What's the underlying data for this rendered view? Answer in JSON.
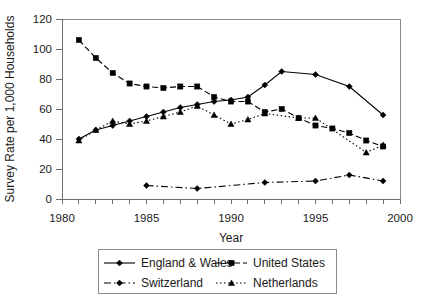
{
  "chart_data": {
    "type": "line",
    "title": "",
    "xlabel": "Year",
    "ylabel": "Survey Rate per 1,000 Households",
    "xlim": [
      1980,
      2000
    ],
    "ylim": [
      0,
      120
    ],
    "ytick_values": [
      0,
      20,
      40,
      60,
      80,
      100,
      120
    ],
    "ytick_labels": [
      "0",
      "20",
      "40",
      "60",
      "80",
      "100",
      "120"
    ],
    "xtick_values": [
      1980,
      1985,
      1990,
      1995,
      2000
    ],
    "xtick_labels": [
      "1980",
      "1985",
      "1990",
      "1995",
      "2000"
    ],
    "xminor_step": 1,
    "grid": false,
    "legend_position": "bottom",
    "series": [
      {
        "name": "England & Wales",
        "marker": "diamond",
        "line_style": "solid",
        "color": "#000000",
        "x": [
          1981,
          1982,
          1983,
          1984,
          1985,
          1986,
          1987,
          1988,
          1989,
          1990,
          1991,
          1992,
          1993,
          1995,
          1997,
          1999
        ],
        "values": [
          40,
          46,
          49,
          52,
          55,
          58,
          61,
          63,
          65,
          66,
          68,
          76,
          85,
          83,
          75,
          56
        ]
      },
      {
        "name": "United States",
        "marker": "square",
        "line_style": "dashed",
        "color": "#000000",
        "x": [
          1981,
          1982,
          1983,
          1984,
          1985,
          1986,
          1987,
          1988,
          1989,
          1990,
          1991,
          1992,
          1993,
          1994,
          1995,
          1996,
          1997,
          1998,
          1999
        ],
        "values": [
          106,
          94,
          84,
          77,
          75,
          74,
          75,
          75,
          68,
          65,
          65,
          58,
          60,
          54,
          49,
          47,
          44,
          39,
          35
        ]
      },
      {
        "name": "Switzerland",
        "marker": "diamond",
        "line_style": "dash-dot",
        "color": "#000000",
        "x": [
          1985,
          1988,
          1992,
          1995,
          1997,
          1999
        ],
        "values": [
          9,
          7,
          11,
          12,
          16,
          12
        ]
      },
      {
        "name": "Netherlands",
        "marker": "triangle",
        "line_style": "dotted",
        "color": "#000000",
        "x": [
          1981,
          1982,
          1983,
          1984,
          1985,
          1986,
          1987,
          1988,
          1989,
          1990,
          1991,
          1992,
          1994,
          1995,
          1998,
          1999
        ],
        "values": [
          39,
          46,
          52,
          50,
          52,
          55,
          58,
          62,
          56,
          50,
          53,
          57,
          54,
          54,
          31,
          36
        ]
      }
    ]
  },
  "axes": {
    "y_title": "Survey Rate per 1,000 Households",
    "x_title": "Year",
    "y_labels": [
      "120",
      "100",
      "80",
      "60",
      "40",
      "20",
      "0"
    ],
    "x_labels": [
      "1980",
      "1985",
      "1990",
      "1995",
      "2000"
    ]
  },
  "legend": {
    "entries": [
      {
        "label": "England & Wales",
        "marker": "diamond",
        "line_style": "solid"
      },
      {
        "label": "United States",
        "marker": "square",
        "line_style": "dashed"
      },
      {
        "label": "Switzerland",
        "marker": "diamond",
        "line_style": "dash-dot"
      },
      {
        "label": "Netherlands",
        "marker": "triangle",
        "line_style": "dotted"
      }
    ]
  }
}
